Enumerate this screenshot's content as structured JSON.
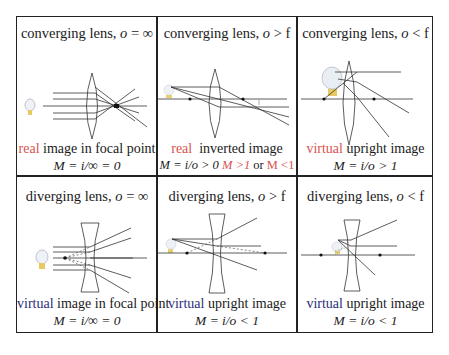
{
  "colors": {
    "real": "#d9534f",
    "virtual_red": "#d9534f",
    "virtual_blue": "#2b2f7a",
    "line": "#222222"
  },
  "cells": [
    {
      "title_prefix": "converging lens, ",
      "title_var": "o",
      "title_rel": " = ∞",
      "keyword": "real",
      "caption_rest": " image in focal point",
      "formula": "M = i/∞ = 0",
      "icons": [
        "light-bulb-icon",
        "converging-lens-icon"
      ]
    },
    {
      "title_prefix": "converging lens, ",
      "title_var": "o",
      "title_rel": " > f",
      "keyword": "real",
      "caption_rest": "  inverted image",
      "formula": "M = i/o > 0 ",
      "formula_extra1": "M >1",
      "formula_or": " or ",
      "formula_extra2": "M <1",
      "icons": [
        "light-bulb-icon",
        "converging-lens-icon"
      ]
    },
    {
      "title_prefix": "converging lens, ",
      "title_var": "o",
      "title_rel": " < f",
      "keyword": "virtual",
      "caption_rest": " upright image",
      "formula": "M = i/o > 1",
      "icons": [
        "light-bulb-icon",
        "converging-lens-icon"
      ]
    },
    {
      "title_prefix": "diverging lens, ",
      "title_var": "o",
      "title_rel": " = ∞",
      "keyword": "virtual",
      "caption_rest": " image in focal point",
      "formula": "M = i/∞ = 0",
      "icons": [
        "light-bulb-icon",
        "diverging-lens-icon"
      ]
    },
    {
      "title_prefix": "diverging lens, ",
      "title_var": "o",
      "title_rel": " > f",
      "keyword": "virtual",
      "caption_rest": " upright image",
      "formula": "M = i/o < 1",
      "icons": [
        "light-bulb-icon",
        "diverging-lens-icon"
      ]
    },
    {
      "title_prefix": "diverging lens, ",
      "title_var": "o",
      "title_rel": " < f",
      "keyword": "virtual",
      "caption_rest": " upright image",
      "formula": "M = i/o < 1",
      "icons": [
        "light-bulb-icon",
        "diverging-lens-icon"
      ]
    }
  ]
}
